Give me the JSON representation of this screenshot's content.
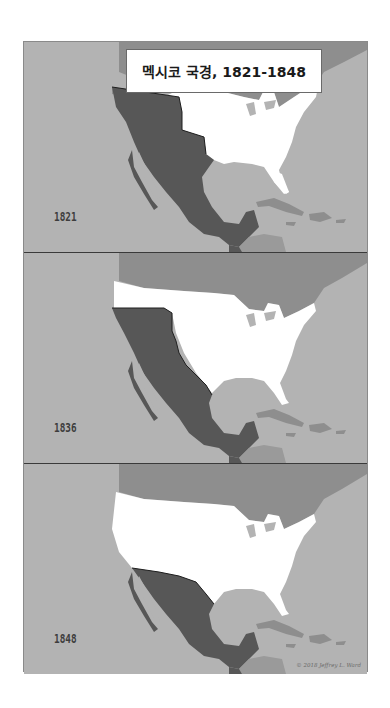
{
  "title": "멕시코 국경, 1821-1848",
  "panels": [
    {
      "year": "1821",
      "label": "Mexico borders in 1821"
    },
    {
      "year": "1836",
      "label": "Mexico borders in 1836"
    },
    {
      "year": "1848",
      "label": "Mexico borders in 1848"
    }
  ],
  "credit": "© 2018 Jeffrey L. Ward",
  "colors": {
    "ocean": "#b3b3b3",
    "other_land": "#8e8e8e",
    "united_states": "#ffffff",
    "mexico": "#575757",
    "central_america": "#9a9a9a",
    "border_line": "#1f1f1f"
  },
  "legend": {
    "mexico": "Mexico (dark gray)",
    "united_states": "United States (white)",
    "other": "Other territories (gray)"
  }
}
